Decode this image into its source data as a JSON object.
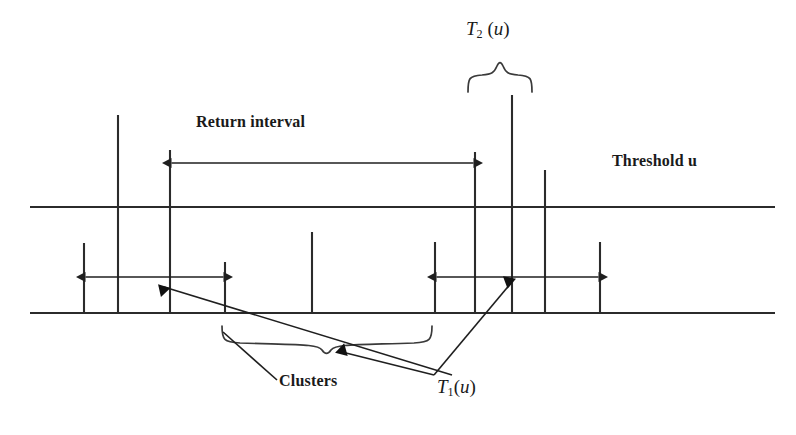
{
  "figure": {
    "title_text": "",
    "stroke_color": "#2b2b2b",
    "background_color": "#ffffff",
    "width": 796,
    "height": 435,
    "labels": {
      "return_interval": "Return interval",
      "threshold": "Threshold u",
      "clusters": "Clusters",
      "t1_symbol": "T",
      "t1_subscript": "1",
      "t1_arg_open": "(",
      "t1_arg_var": "u",
      "t1_arg_close": ")",
      "t2_symbol": "T",
      "t2_subscript": "2",
      "t2_arg_open": " (",
      "t2_arg_var": "u",
      "t2_arg_close": ")"
    },
    "horizontal_lines": [
      {
        "name": "threshold-line",
        "x1": 30,
        "x2": 775,
        "y": 207
      },
      {
        "name": "baseline",
        "x1": 30,
        "x2": 775,
        "y": 313
      }
    ],
    "exceedance_spikes": [
      {
        "name": "spike-1",
        "x": 84,
        "y_top": 243,
        "y_bottom": 313
      },
      {
        "name": "spike-2",
        "x": 118,
        "y_top": 115,
        "y_bottom": 313
      },
      {
        "name": "spike-3",
        "x": 170,
        "y_top": 150,
        "y_bottom": 313
      },
      {
        "name": "spike-4",
        "x": 225,
        "y_top": 262,
        "y_bottom": 313
      },
      {
        "name": "spike-5",
        "x": 312,
        "y_top": 232,
        "y_bottom": 313
      },
      {
        "name": "spike-6",
        "x": 435,
        "y_top": 242,
        "y_bottom": 313
      },
      {
        "name": "spike-7",
        "x": 475,
        "y_top": 152,
        "y_bottom": 313
      },
      {
        "name": "spike-8",
        "x": 512,
        "y_top": 95,
        "y_bottom": 313
      },
      {
        "name": "spike-9",
        "x": 545,
        "y_top": 170,
        "y_bottom": 313
      },
      {
        "name": "spike-10",
        "x": 600,
        "y_top": 242,
        "y_bottom": 313
      }
    ],
    "measure_arrows": [
      {
        "name": "return-interval-arrow",
        "x1": 170,
        "x2": 475,
        "y": 163
      },
      {
        "name": "left-cluster-arrow",
        "x1": 84,
        "x2": 225,
        "y": 277
      },
      {
        "name": "right-cluster-arrow",
        "x1": 435,
        "x2": 600,
        "y": 277
      }
    ],
    "braces": [
      {
        "name": "t2-brace",
        "x1": 452,
        "x2": 548,
        "y": 80,
        "apex_y": 62,
        "direction": "up"
      },
      {
        "name": "clusters-brace",
        "x1": 222,
        "x2": 440,
        "y": 338,
        "apex_y": 356,
        "direction": "down"
      }
    ],
    "leaders": [
      {
        "name": "clusters-leader",
        "x1": 275,
        "y1": 383,
        "x2": 222,
        "y2": 336
      },
      {
        "name": "t1-leader-left",
        "x1": 448,
        "y1": 378,
        "x2": 160,
        "y2": 283
      },
      {
        "name": "t1-leader-right",
        "x1": 430,
        "y1": 378,
        "x2": 513,
        "y2": 277
      },
      {
        "name": "t1-leader-brace",
        "x1": 430,
        "y1": 378,
        "x2": 336,
        "y2": 348
      }
    ],
    "label_positions": {
      "return_interval": {
        "x": 196,
        "y": 124
      },
      "threshold": {
        "x": 612,
        "y": 163
      },
      "clusters": {
        "x": 279,
        "y": 382
      },
      "t1": {
        "x": 437,
        "y": 378
      },
      "t2": {
        "x": 466,
        "y": 20
      }
    }
  }
}
